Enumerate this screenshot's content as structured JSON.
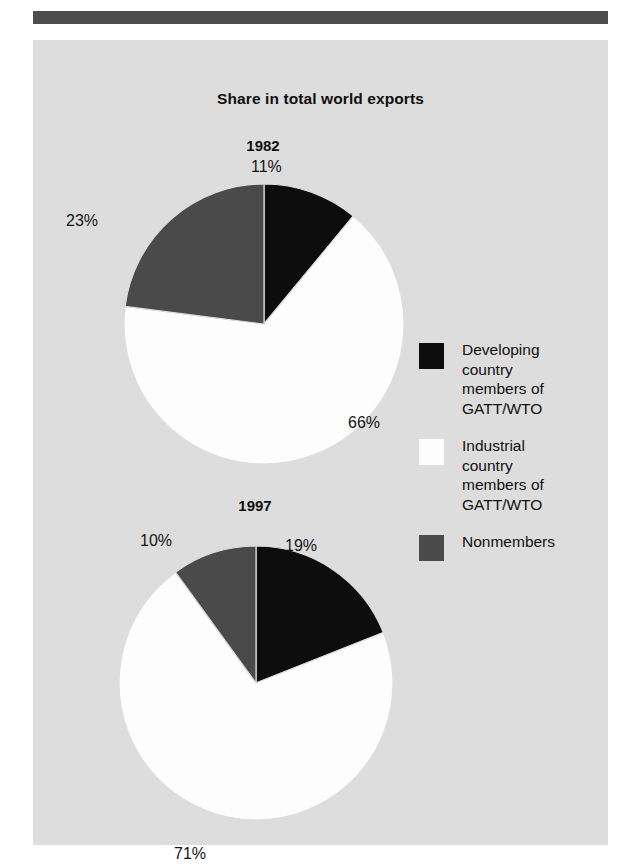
{
  "figure": {
    "title": "Share in total world exports",
    "background_color": "#dddddd",
    "rule_color": "#4d4d4d"
  },
  "legend": {
    "items": [
      {
        "label": "Developing\ncountry\nmembers of\nGATT/WTO",
        "color": "#0d0d0d",
        "swatch_name": "developing-members-swatch"
      },
      {
        "label": "Industrial\ncountry\nmembers of\nGATT/WTO",
        "color": "#fdfdfd",
        "swatch_name": "industrial-members-swatch"
      },
      {
        "label": "Nonmembers",
        "color": "#4a4a4a",
        "swatch_name": "nonmembers-swatch"
      }
    ]
  },
  "chart_data": [
    {
      "type": "pie",
      "title": "1982",
      "labels": [
        "Developing country members of GATT/WTO",
        "Industrial country members of GATT/WTO",
        "Nonmembers"
      ],
      "values": [
        11,
        23,
        66
      ],
      "value_labels": [
        "11%",
        "23%",
        "66%"
      ],
      "slice_order": [
        "Developing country members of GATT/WTO",
        "Industrial country members of GATT/WTO",
        "Nonmembers"
      ],
      "ordered_values": [
        11,
        66,
        23
      ],
      "ordered_value_labels": [
        "11%",
        "66%",
        "23%"
      ],
      "colors": [
        "#0d0d0d",
        "#fdfdfd",
        "#4a4a4a"
      ],
      "start_angle_deg": 0,
      "direction": "clockwise",
      "units": "percent of total world exports"
    },
    {
      "type": "pie",
      "title": "1997",
      "labels": [
        "Developing country members of GATT/WTO",
        "Industrial country members of GATT/WTO",
        "Nonmembers"
      ],
      "values": [
        19,
        10,
        71
      ],
      "value_labels": [
        "19%",
        "10%",
        "71%"
      ],
      "slice_order": [
        "Developing country members of GATT/WTO",
        "Industrial country members of GATT/WTO",
        "Nonmembers"
      ],
      "ordered_values": [
        19,
        71,
        10
      ],
      "ordered_value_labels": [
        "19%",
        "71%",
        "10%"
      ],
      "colors": [
        "#0d0d0d",
        "#fdfdfd",
        "#4a4a4a"
      ],
      "start_angle_deg": 0,
      "direction": "clockwise",
      "units": "percent of total world exports"
    }
  ]
}
